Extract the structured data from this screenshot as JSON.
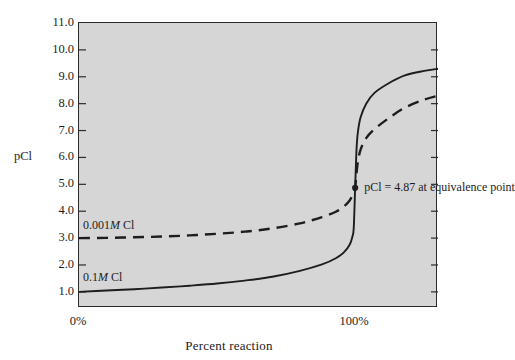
{
  "chart_data": {
    "type": "line",
    "title": "",
    "xlabel": "Percent reaction",
    "ylabel": "pCl",
    "xlim": [
      0,
      130
    ],
    "ylim": [
      0.4,
      11.0
    ],
    "grid": false,
    "legend_position": "inline-labels",
    "xticks": [
      {
        "value": 0,
        "label": "0%"
      },
      {
        "value": 100,
        "label": "100%"
      }
    ],
    "yticks": [
      {
        "value": 11.0,
        "label": "11.0"
      },
      {
        "value": 10.0,
        "label": "10.0"
      },
      {
        "value": 9.0,
        "label": "9.0"
      },
      {
        "value": 8.0,
        "label": "8.0"
      },
      {
        "value": 7.0,
        "label": "7.0"
      },
      {
        "value": 6.0,
        "label": "6.0"
      },
      {
        "value": 5.0,
        "label": "5.0"
      },
      {
        "value": 4.0,
        "label": "4.0"
      },
      {
        "value": 3.0,
        "label": "3.0"
      },
      {
        "value": 2.0,
        "label": "2.0"
      },
      {
        "value": 1.0,
        "label": "1.0"
      }
    ],
    "series": [
      {
        "name": "0.1M Cl",
        "label_prefix": "0.1",
        "label_italic": "M",
        "label_suffix": " Cl",
        "style": "solid",
        "color": "#1d1d1d",
        "x": [
          0,
          10,
          20,
          30,
          40,
          50,
          60,
          70,
          80,
          88,
          93,
          96,
          98,
          99,
          99.5,
          100,
          100.5,
          101,
          102,
          104,
          107,
          112,
          118,
          125,
          130
        ],
        "y": [
          1.0,
          1.05,
          1.1,
          1.16,
          1.23,
          1.31,
          1.42,
          1.56,
          1.78,
          2.02,
          2.25,
          2.48,
          2.75,
          3.05,
          3.4,
          4.87,
          6.3,
          6.95,
          7.5,
          8.0,
          8.4,
          8.75,
          9.05,
          9.22,
          9.3
        ]
      },
      {
        "name": "0.001M Cl",
        "label_prefix": "0.001",
        "label_italic": "M",
        "label_suffix": " Cl",
        "style": "dashed",
        "color": "#1d1d1d",
        "x": [
          0,
          10,
          20,
          30,
          40,
          50,
          60,
          70,
          80,
          88,
          93,
          96,
          98,
          99,
          99.5,
          100,
          100.5,
          101,
          102,
          104,
          107,
          112,
          118,
          125,
          130
        ],
        "y": [
          3.0,
          3.01,
          3.03,
          3.06,
          3.1,
          3.16,
          3.24,
          3.36,
          3.55,
          3.78,
          3.98,
          4.18,
          4.4,
          4.58,
          4.72,
          4.87,
          5.4,
          5.85,
          6.3,
          6.72,
          7.05,
          7.45,
          7.85,
          8.15,
          8.3
        ]
      }
    ],
    "annotations": [
      {
        "name": "equivalence-point",
        "text": "pCl = 4.87 at equivalence point",
        "x": 100,
        "y": 4.87,
        "marker": "dot"
      }
    ]
  },
  "axes": {
    "y_title": "pCl",
    "x_title": "Percent reaction"
  }
}
